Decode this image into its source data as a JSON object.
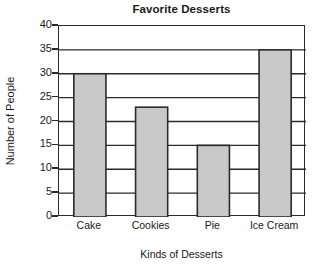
{
  "chart_data": {
    "type": "bar",
    "title": "Favorite Desserts",
    "xlabel": "Kinds of Desserts",
    "ylabel": "Number of People",
    "categories": [
      "Cake",
      "Cookies",
      "Pie",
      "Ice Cream"
    ],
    "values": [
      30,
      23,
      15,
      35
    ],
    "ylim": [
      0,
      40
    ],
    "ytick_labels": [
      "0",
      "5",
      "10",
      "15",
      "20",
      "25",
      "30",
      "35",
      "40"
    ],
    "ytick_values": [
      0,
      5,
      10,
      15,
      20,
      25,
      30,
      35,
      40
    ],
    "grid": "horizontal",
    "legend": "none",
    "bar_fill_color": "#c9c9c9",
    "bar_edge_color": "#2b2b2b",
    "axis_color": "#2b2b2b",
    "gridline_color": "#2b2b2b",
    "background_color": "#ffffff",
    "text_color": "#1a1a1a"
  }
}
